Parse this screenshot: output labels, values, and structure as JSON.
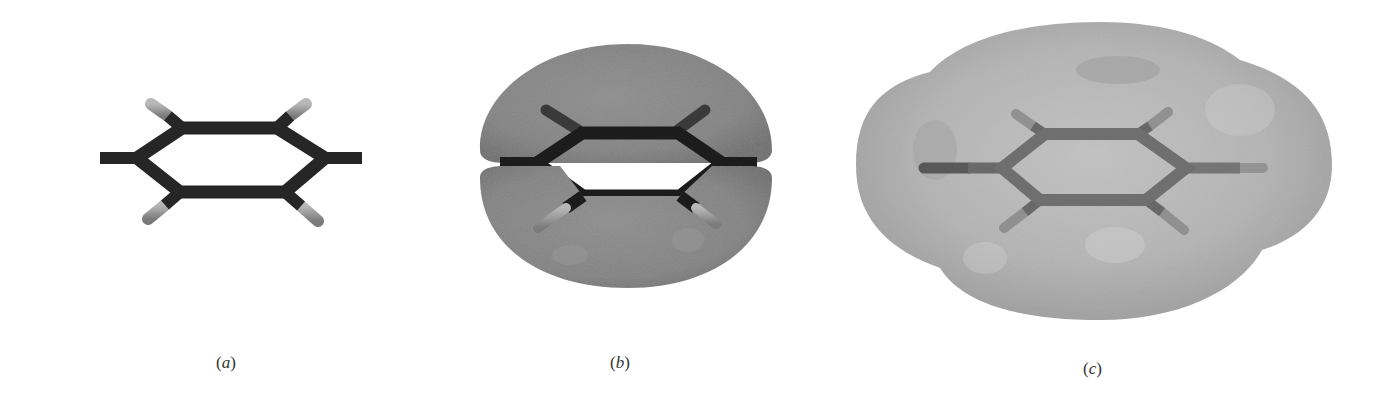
{
  "figure": {
    "panels": [
      {
        "id": "a",
        "label_letter": "a",
        "label_open": "(",
        "label_close": ")",
        "depiction": "benzene ball-and-stick model",
        "surface": "none"
      },
      {
        "id": "b",
        "label_letter": "b",
        "label_open": "(",
        "label_close": ")",
        "depiction": "benzene with dark pi-electron cloud surface",
        "surface": "dark-gray"
      },
      {
        "id": "c",
        "label_letter": "c",
        "label_open": "(",
        "label_close": ")",
        "depiction": "benzene with light electron density surface",
        "surface": "light-gray"
      }
    ],
    "colors": {
      "background": "#ffffff",
      "bond_dark": "#262626",
      "hydrogen": "#9a9a9a",
      "cloud_b": "#858585",
      "cloud_c": "#b4b4b4",
      "label": "#333333"
    }
  }
}
